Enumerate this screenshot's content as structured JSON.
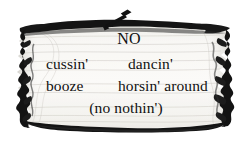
{
  "scene": {
    "name": "wooden-sign-illustration",
    "background_color": "#ffffff",
    "plank_fill_color": "#f7f6f2",
    "plank_outline_color": "#111111",
    "ink_color": "#111111"
  },
  "nail": {
    "icon": "nail-icon",
    "description": "nail driven through top of plank, head at upper right, point angled down-left"
  },
  "sign": {
    "lines": [
      {
        "id": "line-1",
        "text": "NO",
        "align": "center"
      },
      {
        "id": "line-2",
        "left_text": "cussin'",
        "right_text": "dancin'"
      },
      {
        "id": "line-3",
        "left_text": "booze",
        "right_text": "horsin' around"
      },
      {
        "id": "line-4",
        "text": "(no nothin')",
        "align": "center"
      }
    ],
    "full_text": "NO cussin' dancin' booze horsin' around (no nothin')"
  }
}
